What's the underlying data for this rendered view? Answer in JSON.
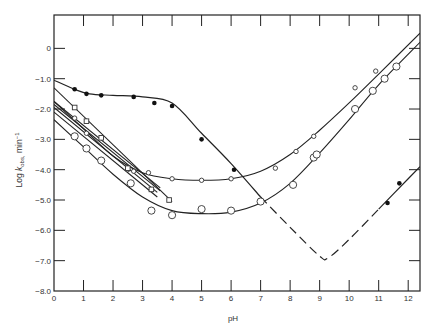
{
  "chart_data": {
    "type": "scatter",
    "title": "",
    "xlabel": "pH",
    "ylabel": "Log k_obs, min^-1",
    "ylabel_main": "Log ",
    "ylabel_k": "k",
    "ylabel_sub": "obs,",
    "ylabel_unit": " min",
    "ylabel_exp": "−1",
    "xlim": [
      0,
      12.4
    ],
    "ylim": [
      -8.0,
      1.1
    ],
    "xticks": [
      "0",
      "1",
      "2",
      "3",
      "4",
      "5",
      "6",
      "7",
      "8",
      "9",
      "10",
      "11",
      "12"
    ],
    "yticks": [
      "0",
      "−1.0",
      "−2.0",
      "−3.0",
      "−4.0",
      "−5.0",
      "−6.0",
      "−7.0",
      "−8.0"
    ],
    "grid": false,
    "series": [
      {
        "name": "filled circles",
        "marker": "filled-circle",
        "points": [
          [
            0.7,
            -1.35
          ],
          [
            1.1,
            -1.5
          ],
          [
            1.6,
            -1.55
          ],
          [
            2.7,
            -1.6
          ],
          [
            3.4,
            -1.8
          ],
          [
            4.0,
            -1.9
          ],
          [
            5.0,
            -3.0
          ],
          [
            6.1,
            -4.0
          ],
          [
            7.0,
            -5.0
          ],
          [
            11.3,
            -5.1
          ],
          [
            11.7,
            -4.45
          ]
        ],
        "curve": [
          [
            0,
            -1.05
          ],
          [
            0.7,
            -1.35
          ],
          [
            1.2,
            -1.5
          ],
          [
            2,
            -1.55
          ],
          [
            3,
            -1.6
          ],
          [
            4,
            -1.8
          ],
          [
            5,
            -2.8
          ],
          [
            6,
            -3.8
          ],
          [
            7,
            -4.9
          ],
          [
            8,
            -5.9
          ],
          [
            9,
            -6.85
          ],
          [
            9.3,
            -6.9
          ],
          [
            10,
            -6.3
          ],
          [
            11,
            -5.3
          ],
          [
            12,
            -4.3
          ],
          [
            12.4,
            -3.9
          ]
        ],
        "dashed_range": [
          7.1,
          11.5
        ]
      },
      {
        "name": "small open circles",
        "marker": "small-open-circle",
        "points": [
          [
            0.7,
            -2.3
          ],
          [
            1.1,
            -2.8
          ],
          [
            2.5,
            -4.0
          ],
          [
            2.7,
            -4.05
          ],
          [
            3.2,
            -4.1
          ],
          [
            4,
            -4.3
          ],
          [
            5,
            -4.35
          ],
          [
            6,
            -4.3
          ],
          [
            7.5,
            -3.95
          ],
          [
            8.2,
            -3.4
          ],
          [
            8.8,
            -2.9
          ],
          [
            10.2,
            -1.3
          ],
          [
            10.9,
            -0.75
          ]
        ],
        "curve": [
          [
            0,
            -1.75
          ],
          [
            1,
            -2.65
          ],
          [
            2,
            -3.55
          ],
          [
            3,
            -4.1
          ],
          [
            4,
            -4.3
          ],
          [
            5,
            -4.35
          ],
          [
            6,
            -4.3
          ],
          [
            7,
            -4.05
          ],
          [
            8,
            -3.5
          ],
          [
            9,
            -2.7
          ],
          [
            10,
            -1.8
          ],
          [
            11,
            -0.85
          ],
          [
            12.4,
            0.5
          ]
        ]
      },
      {
        "name": "large open circles",
        "marker": "large-open-circle",
        "points": [
          [
            0.7,
            -2.9
          ],
          [
            1.1,
            -3.3
          ],
          [
            1.6,
            -3.7
          ],
          [
            2.6,
            -4.45
          ],
          [
            3.3,
            -5.35
          ],
          [
            4,
            -5.5
          ],
          [
            5,
            -5.3
          ],
          [
            6,
            -5.35
          ],
          [
            7,
            -5.05
          ],
          [
            8.1,
            -4.5
          ],
          [
            8.8,
            -3.6
          ],
          [
            8.9,
            -3.5
          ],
          [
            10.2,
            -2.0
          ],
          [
            10.8,
            -1.4
          ],
          [
            11.2,
            -1.0
          ],
          [
            11.6,
            -0.6
          ]
        ],
        "curve": [
          [
            0,
            -2.35
          ],
          [
            1,
            -3.25
          ],
          [
            2,
            -4.15
          ],
          [
            3,
            -4.9
          ],
          [
            4,
            -5.35
          ],
          [
            5,
            -5.45
          ],
          [
            6,
            -5.4
          ],
          [
            7,
            -5.1
          ],
          [
            8,
            -4.45
          ],
          [
            9,
            -3.45
          ],
          [
            10,
            -2.35
          ],
          [
            11,
            -1.2
          ],
          [
            12.4,
            0.2
          ]
        ]
      },
      {
        "name": "open squares",
        "marker": "open-square",
        "points": [
          [
            0.7,
            -1.95
          ],
          [
            1.1,
            -2.4
          ],
          [
            1.6,
            -2.95
          ],
          [
            2.5,
            -3.95
          ],
          [
            3.3,
            -4.65
          ],
          [
            3.9,
            -5.0
          ]
        ],
        "curve": [
          [
            0,
            -1.3
          ],
          [
            4,
            -5.05
          ]
        ]
      },
      {
        "name": "parallel line A",
        "marker": "none",
        "curve": [
          [
            0,
            -1.75
          ],
          [
            3.6,
            -4.6
          ]
        ]
      },
      {
        "name": "parallel line B",
        "marker": "none",
        "curve": [
          [
            0,
            -1.85
          ],
          [
            3.6,
            -4.7
          ]
        ]
      },
      {
        "name": "parallel line C",
        "marker": "none",
        "curve": [
          [
            0,
            -1.95
          ],
          [
            3.5,
            -4.75
          ]
        ]
      },
      {
        "name": "parallel line D",
        "marker": "none",
        "curve": [
          [
            0,
            -2.1
          ],
          [
            3.5,
            -4.9
          ]
        ]
      }
    ]
  }
}
